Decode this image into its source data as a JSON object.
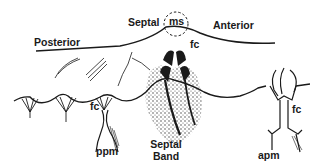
{
  "diagram": {
    "labels": {
      "posterior": "Posterior",
      "septal": "Septal",
      "anterior": "Anterior",
      "ms": "ms",
      "fc_top": "fc",
      "fc_left": "fc",
      "fc_right": "fc",
      "ppm": "ppm",
      "apm": "apm",
      "septal_band_line1": "Septal",
      "septal_band_line2": "Band"
    },
    "colors": {
      "ink": "#1a1a1a",
      "background": "#ffffff"
    }
  }
}
